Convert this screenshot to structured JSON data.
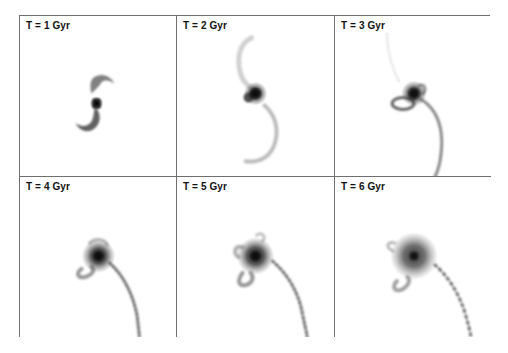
{
  "figure": {
    "layout": {
      "rows": 2,
      "cols": 3
    },
    "panels": [
      {
        "label": "T = 1 Gyr",
        "time_gyr": 1
      },
      {
        "label": "T = 2 Gyr",
        "time_gyr": 2
      },
      {
        "label": "T = 3 Gyr",
        "time_gyr": 3
      },
      {
        "label": "T = 4 Gyr",
        "time_gyr": 4
      },
      {
        "label": "T = 5 Gyr",
        "time_gyr": 5
      },
      {
        "label": "T = 6 Gyr",
        "time_gyr": 6
      }
    ],
    "colors": {
      "border": "#6f6f6f",
      "particles": "#3a3a3a",
      "core": "#111111",
      "background": "#ffffff"
    }
  }
}
